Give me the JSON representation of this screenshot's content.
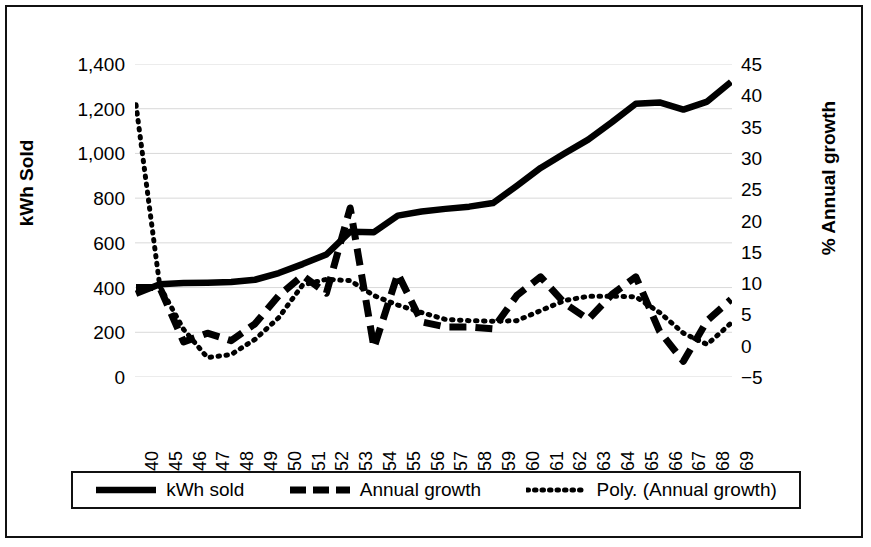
{
  "chart_data": {
    "type": "line",
    "title": "",
    "xlabel": "",
    "ylabel": "kWh Sold",
    "y2label": "% Annual growth",
    "grid": true,
    "legend_position": "bottom",
    "categories": [
      "1940",
      "1945",
      "1946",
      "1947",
      "1948",
      "1949",
      "1950",
      "1951",
      "1952",
      "1953",
      "1954",
      "1955",
      "1956",
      "1957",
      "1958",
      "1959",
      "1960",
      "1961",
      "1962",
      "1963",
      "1964",
      "1965",
      "1966",
      "1967",
      "1968",
      "1969"
    ],
    "ylim": [
      0,
      1400
    ],
    "y2lim": [
      -5,
      45
    ],
    "yticks": [
      "0",
      "200",
      "400",
      "600",
      "800",
      "1,000",
      "1,200",
      "1,400"
    ],
    "ytick_values": [
      0,
      200,
      400,
      600,
      800,
      1000,
      1200,
      1400
    ],
    "y2ticks": [
      "−5",
      "0",
      "5",
      "10",
      "15",
      "20",
      "25",
      "30",
      "35",
      "40",
      "45"
    ],
    "y2tick_values": [
      -5,
      0,
      5,
      10,
      15,
      20,
      25,
      30,
      35,
      40,
      45
    ],
    "series": [
      {
        "name": "kWh sold",
        "axis": "left",
        "style": "solid",
        "values": [
          372,
          415,
          420,
          422,
          425,
          435,
          465,
          505,
          548,
          650,
          648,
          722,
          740,
          752,
          762,
          778,
          855,
          935,
          1000,
          1062,
          1140,
          1222,
          1228,
          1196,
          1232,
          1320
        ]
      },
      {
        "name": "Annual growth",
        "axis": "right",
        "style": "dashed",
        "values": [
          9.3,
          9.3,
          0.6,
          2.0,
          0.8,
          3.5,
          8.0,
          11.2,
          8.4,
          22.0,
          -0.3,
          11.5,
          3.8,
          3.0,
          3.0,
          2.7,
          8.0,
          11.0,
          6.8,
          4.2,
          8.2,
          11.0,
          2.3,
          -2.5,
          4.0,
          7.4
        ]
      },
      {
        "name": "Poly. (Annual growth)",
        "axis": "right",
        "style": "dotted",
        "values": [
          38.5,
          9.5,
          2.6,
          -1.9,
          -1.4,
          1.0,
          4.5,
          9.7,
          10.6,
          10.4,
          8.0,
          6.5,
          5.3,
          4.2,
          4.0,
          3.9,
          4.0,
          5.6,
          7.2,
          7.9,
          7.9,
          7.8,
          5.3,
          2.0,
          0.2,
          3.6
        ]
      }
    ]
  },
  "axes": {
    "left_title": "kWh Sold",
    "right_title": "% Annual growth"
  },
  "legend": {
    "items": [
      {
        "label": "kWh sold",
        "style": "solid"
      },
      {
        "label": "Annual growth",
        "style": "dashed"
      },
      {
        "label": "Poly. (Annual growth)",
        "style": "dotted"
      }
    ]
  },
  "colors": {
    "line": "#000000",
    "grid": "#d9d9d9",
    "border": "#111111",
    "background": "#ffffff"
  }
}
